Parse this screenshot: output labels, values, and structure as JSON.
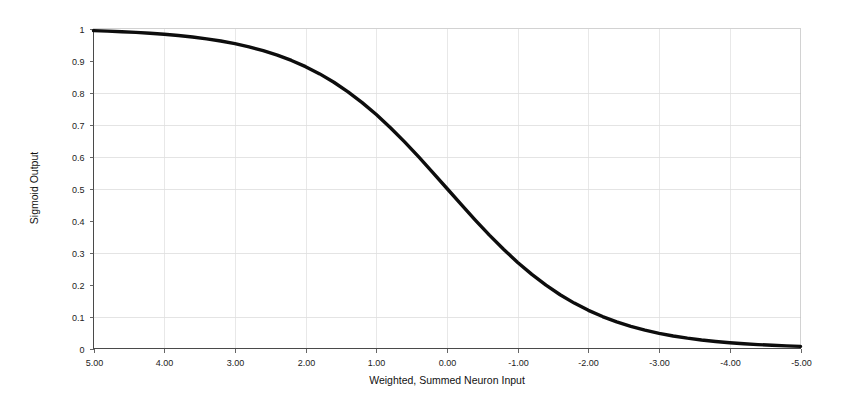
{
  "chart_data": {
    "type": "line",
    "title": "",
    "xlabel": "Weighted, Summed Neuron Input",
    "ylabel": "Sigmoid Output",
    "xlim": [
      5.0,
      -5.0
    ],
    "ylim": [
      0,
      1
    ],
    "x_axis_reversed": true,
    "grid": true,
    "legend": "none",
    "xticklabels": [
      "5.00",
      "4.00",
      "3.00",
      "2.00",
      "1.00",
      "0.00",
      "-1.00",
      "-2.00",
      "-3.00",
      "-4.00",
      "-5.00"
    ],
    "xticks": [
      5,
      4,
      3,
      2,
      1,
      0,
      -1,
      -2,
      -3,
      -4,
      -5
    ],
    "yticklabels": [
      "1",
      "0.9",
      "0.8",
      "0.7",
      "0.6",
      "0.5",
      "0.4",
      "0.3",
      "0.2",
      "0.1",
      "0"
    ],
    "yticks": [
      1,
      0.9,
      0.8,
      0.7,
      0.6,
      0.5,
      0.4,
      0.3,
      0.2,
      0.1,
      0
    ],
    "y_gridlines": [
      0.8,
      0.7,
      0.6,
      0.5,
      0.3,
      0.1
    ],
    "series": [
      {
        "name": "Sigmoid Output",
        "color": "#0d0d0d",
        "x": [
          5.0,
          4.8,
          4.6,
          4.4,
          4.2,
          4.0,
          3.8,
          3.6,
          3.4,
          3.2,
          3.0,
          2.8,
          2.6,
          2.4,
          2.2,
          2.0,
          1.8,
          1.6,
          1.4,
          1.2,
          1.0,
          0.8,
          0.6,
          0.4,
          0.2,
          0.0,
          -0.2,
          -0.4,
          -0.6,
          -0.8,
          -1.0,
          -1.2,
          -1.4,
          -1.6,
          -1.8,
          -2.0,
          -2.2,
          -2.4,
          -2.6,
          -2.8,
          -3.0,
          -3.2,
          -3.4,
          -3.6,
          -3.8,
          -4.0,
          -4.2,
          -4.4,
          -4.6,
          -4.8,
          -5.0
        ],
        "y": [
          0.9933,
          0.9918,
          0.99,
          0.9879,
          0.9852,
          0.982,
          0.978,
          0.9734,
          0.9677,
          0.9608,
          0.9526,
          0.9427,
          0.9309,
          0.9168,
          0.9002,
          0.8808,
          0.8581,
          0.832,
          0.8022,
          0.7685,
          0.7311,
          0.69,
          0.6457,
          0.5987,
          0.5498,
          0.5,
          0.4502,
          0.4013,
          0.3543,
          0.31,
          0.2689,
          0.2315,
          0.1978,
          0.168,
          0.1419,
          0.1192,
          0.0998,
          0.0832,
          0.0691,
          0.0573,
          0.0474,
          0.0392,
          0.0323,
          0.0266,
          0.0219,
          0.018,
          0.0148,
          0.0121,
          0.01,
          0.0082,
          0.0067
        ]
      }
    ]
  },
  "figure": {
    "background_color": "#ffffff",
    "line_color": "#0d0d0d",
    "grid_color": "#d9d9d9",
    "axis_color": "#4a4a4a"
  }
}
